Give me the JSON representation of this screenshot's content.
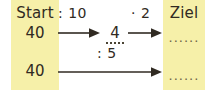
{
  "colors": {
    "band": "#f6f0a9",
    "background": "#ffffff",
    "ink": "#302a22",
    "blank_ink": "#6b6346"
  },
  "columns": {
    "start_header": "Start",
    "ziel_header": "Ziel"
  },
  "rows": [
    {
      "start_value": "40",
      "operations": [
        ": 10",
        "· 2"
      ],
      "intermediate_value": "4",
      "target_value": "......"
    },
    {
      "start_value": "40",
      "operations": [
        ": 5"
      ],
      "target_value": "......"
    }
  ],
  "icons": {
    "arrow_right": "arrow-right-icon"
  }
}
